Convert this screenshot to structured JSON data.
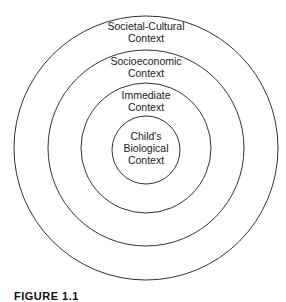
{
  "diagram": {
    "type": "concentric-circles",
    "layers": [
      {
        "id": "societal-cultural",
        "lines": [
          "Societal-Cultural",
          "Context"
        ]
      },
      {
        "id": "socioeconomic",
        "lines": [
          "Socioeconomic",
          "Context"
        ]
      },
      {
        "id": "immediate",
        "lines": [
          "Immediate",
          "Context"
        ]
      },
      {
        "id": "childs-biological",
        "lines": [
          "Child's",
          "Biological",
          "Context"
        ]
      }
    ],
    "line_color": "#333333",
    "background": "#ffffff"
  },
  "caption": "FIGURE 1.1"
}
